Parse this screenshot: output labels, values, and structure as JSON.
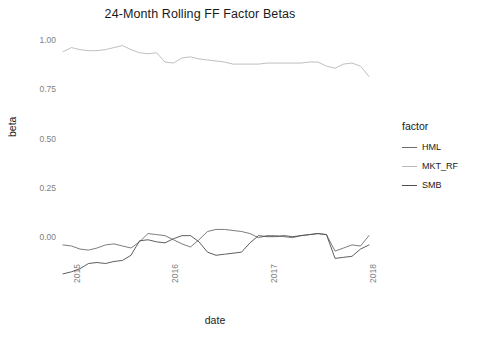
{
  "chart_data": {
    "type": "line",
    "title": "24-Month Rolling FF Factor Betas",
    "xlabel": "date",
    "ylabel": "beta",
    "grid": false,
    "legend_position": "right",
    "legend_title": "factor",
    "xlim": [
      "2015",
      "2018"
    ],
    "ylim": [
      -0.15,
      1.05
    ],
    "yticks": [
      "1.00",
      "0.75",
      "0.50",
      "0.25",
      "0.00"
    ],
    "ytick_values": [
      1.0,
      0.75,
      0.5,
      0.25,
      0.0
    ],
    "xticks": [
      "2015",
      "2016",
      "2017",
      "2018"
    ],
    "xtick_values": [
      2015.0,
      2016.0,
      2017.0,
      2018.0
    ],
    "x": [
      2015.0,
      2015.083,
      2015.167,
      2015.25,
      2015.333,
      2015.417,
      2015.5,
      2015.583,
      2015.667,
      2015.75,
      2015.833,
      2015.917,
      2016.0,
      2016.083,
      2016.167,
      2016.25,
      2016.333,
      2016.417,
      2016.5,
      2016.583,
      2016.667,
      2016.75,
      2016.833,
      2016.917,
      2017.0,
      2017.083,
      2017.167,
      2017.25,
      2017.333,
      2017.417,
      2017.5,
      2017.583,
      2017.667,
      2017.75,
      2017.833,
      2017.917,
      2018.0
    ],
    "series": [
      {
        "name": "HML",
        "color": "#6e6e6e",
        "values": [
          0.01,
          0.005,
          -0.01,
          -0.015,
          -0.005,
          0.01,
          0.015,
          0.005,
          -0.005,
          0.025,
          0.065,
          0.06,
          0.055,
          0.035,
          0.015,
          0.0,
          0.035,
          0.075,
          0.085,
          0.085,
          0.08,
          0.075,
          0.065,
          0.045,
          0.055,
          0.055,
          0.05,
          0.045,
          0.055,
          0.06,
          0.065,
          0.06,
          -0.02,
          -0.005,
          0.01,
          0.005,
          0.055
        ]
      },
      {
        "name": "MKT_RF",
        "color": "#b8b8b8",
        "values": [
          0.945,
          0.965,
          0.955,
          0.95,
          0.95,
          0.955,
          0.965,
          0.975,
          0.955,
          0.94,
          0.935,
          0.94,
          0.895,
          0.89,
          0.915,
          0.92,
          0.91,
          0.905,
          0.9,
          0.895,
          0.885,
          0.885,
          0.885,
          0.885,
          0.89,
          0.89,
          0.89,
          0.89,
          0.89,
          0.895,
          0.895,
          0.875,
          0.865,
          0.885,
          0.89,
          0.875,
          0.825
        ]
      },
      {
        "name": "SMB",
        "color": "#4d4d4d",
        "values": [
          -0.13,
          -0.12,
          -0.105,
          -0.08,
          -0.075,
          -0.08,
          -0.07,
          -0.065,
          -0.04,
          0.03,
          0.035,
          0.025,
          0.02,
          0.04,
          0.055,
          0.055,
          0.025,
          -0.025,
          -0.04,
          -0.035,
          -0.03,
          -0.025,
          0.02,
          0.055,
          0.05,
          0.05,
          0.055,
          0.05,
          0.055,
          0.06,
          0.065,
          0.06,
          -0.055,
          -0.05,
          -0.045,
          -0.01,
          0.01
        ]
      }
    ]
  },
  "legend": {
    "title": "factor",
    "items": [
      {
        "label": "HML"
      },
      {
        "label": "MKT_RF"
      },
      {
        "label": "SMB"
      }
    ]
  }
}
